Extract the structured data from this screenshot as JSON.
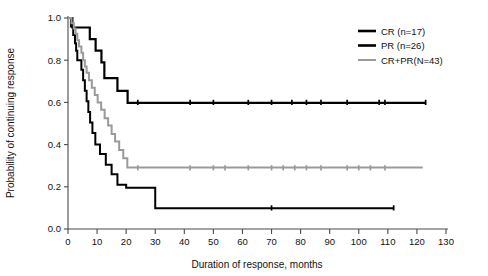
{
  "chart_data": {
    "type": "line",
    "title": "",
    "xlabel": "Duration of response, months",
    "ylabel": "Probability of continuing response",
    "xlim": [
      0,
      130
    ],
    "ylim": [
      0.0,
      1.0
    ],
    "xticks": [
      "0",
      "10",
      "20",
      "30",
      "40",
      "50",
      "60",
      "70",
      "80",
      "90",
      "100",
      "110",
      "120",
      "130"
    ],
    "yticks": [
      "0.0",
      "0.2",
      "0.4",
      "0.6",
      "0.8",
      "1.0"
    ],
    "grid": false,
    "legend_position": "upper right",
    "series": [
      {
        "name": "CR (n=17)",
        "label": "CR (n=17)",
        "color": "#000000",
        "width": 2.2,
        "steps": [
          [
            0,
            1.0
          ],
          [
            1.5,
            1.0
          ],
          [
            1.5,
            0.955
          ],
          [
            7.5,
            0.955
          ],
          [
            7.5,
            0.9
          ],
          [
            9.5,
            0.9
          ],
          [
            9.5,
            0.845
          ],
          [
            11.5,
            0.845
          ],
          [
            11.5,
            0.79
          ],
          [
            12.5,
            0.79
          ],
          [
            12.5,
            0.715
          ],
          [
            17.0,
            0.715
          ],
          [
            17.0,
            0.655
          ],
          [
            20.5,
            0.655
          ],
          [
            20.5,
            0.598
          ],
          [
            123.0,
            0.598
          ]
        ],
        "censor_months": [
          24,
          42,
          50,
          62,
          70,
          77,
          82,
          87,
          96,
          107,
          109,
          123
        ],
        "plateau_value": 0.6
      },
      {
        "name": "PR (n=26)",
        "label": "PR (n=26)",
        "color": "#000000",
        "width": 2.0,
        "steps": [
          [
            0,
            1.0
          ],
          [
            1.0,
            1.0
          ],
          [
            1.0,
            0.96
          ],
          [
            1.8,
            0.96
          ],
          [
            1.8,
            0.92
          ],
          [
            2.4,
            0.92
          ],
          [
            2.4,
            0.88
          ],
          [
            2.8,
            0.88
          ],
          [
            2.8,
            0.845
          ],
          [
            3.2,
            0.845
          ],
          [
            3.2,
            0.8
          ],
          [
            4.6,
            0.8
          ],
          [
            4.6,
            0.755
          ],
          [
            5.2,
            0.755
          ],
          [
            5.2,
            0.705
          ],
          [
            5.8,
            0.705
          ],
          [
            5.8,
            0.655
          ],
          [
            6.4,
            0.655
          ],
          [
            6.4,
            0.605
          ],
          [
            7.0,
            0.605
          ],
          [
            7.0,
            0.555
          ],
          [
            7.6,
            0.555
          ],
          [
            7.6,
            0.505
          ],
          [
            8.4,
            0.505
          ],
          [
            8.4,
            0.455
          ],
          [
            9.4,
            0.455
          ],
          [
            9.4,
            0.4
          ],
          [
            11.0,
            0.4
          ],
          [
            11.0,
            0.355
          ],
          [
            13.0,
            0.355
          ],
          [
            13.0,
            0.305
          ],
          [
            15.0,
            0.305
          ],
          [
            15.0,
            0.26
          ],
          [
            17.0,
            0.26
          ],
          [
            17.0,
            0.21
          ],
          [
            20.0,
            0.21
          ],
          [
            20.0,
            0.195
          ],
          [
            30.0,
            0.195
          ],
          [
            30.0,
            0.098
          ],
          [
            112.0,
            0.098
          ]
        ],
        "censor_months": [
          70,
          112
        ],
        "plateau_value": 0.1
      },
      {
        "name": "CR+PR(N=43)",
        "label": "CR+PR(N=43)",
        "color": "#9a9a9a",
        "width": 2.0,
        "steps": [
          [
            0,
            1.0
          ],
          [
            1.2,
            1.0
          ],
          [
            1.2,
            0.975
          ],
          [
            2.0,
            0.975
          ],
          [
            2.0,
            0.95
          ],
          [
            2.6,
            0.95
          ],
          [
            2.6,
            0.925
          ],
          [
            3.2,
            0.925
          ],
          [
            3.2,
            0.895
          ],
          [
            3.8,
            0.895
          ],
          [
            3.8,
            0.865
          ],
          [
            4.6,
            0.865
          ],
          [
            4.6,
            0.835
          ],
          [
            5.2,
            0.835
          ],
          [
            5.2,
            0.8
          ],
          [
            5.8,
            0.8
          ],
          [
            5.8,
            0.77
          ],
          [
            6.4,
            0.77
          ],
          [
            6.4,
            0.74
          ],
          [
            7.2,
            0.74
          ],
          [
            7.2,
            0.705
          ],
          [
            8.2,
            0.705
          ],
          [
            8.2,
            0.67
          ],
          [
            9.2,
            0.67
          ],
          [
            9.2,
            0.635
          ],
          [
            10.2,
            0.635
          ],
          [
            10.2,
            0.6
          ],
          [
            11.4,
            0.6
          ],
          [
            11.4,
            0.565
          ],
          [
            12.6,
            0.565
          ],
          [
            12.6,
            0.525
          ],
          [
            13.8,
            0.525
          ],
          [
            13.8,
            0.49
          ],
          [
            15.0,
            0.49
          ],
          [
            15.0,
            0.45
          ],
          [
            16.2,
            0.45
          ],
          [
            16.2,
            0.415
          ],
          [
            17.6,
            0.415
          ],
          [
            17.6,
            0.375
          ],
          [
            19.0,
            0.375
          ],
          [
            19.0,
            0.335
          ],
          [
            20.4,
            0.335
          ],
          [
            20.4,
            0.292
          ],
          [
            122.0,
            0.292
          ]
        ],
        "censor_months": [
          24,
          42,
          50,
          54,
          62,
          70,
          74,
          78,
          82,
          87,
          96,
          100,
          104,
          109
        ],
        "plateau_value": 0.29
      }
    ]
  },
  "legend": {
    "entries": [
      {
        "label": "CR (n=17)",
        "color": "#000000"
      },
      {
        "label": "PR (n=26)",
        "color": "#000000"
      },
      {
        "label": "CR+PR(N=43)",
        "color": "#9a9a9a"
      }
    ]
  },
  "axes": {
    "x_title": "Duration of response, months",
    "y_title": "Probability of continuing response"
  }
}
